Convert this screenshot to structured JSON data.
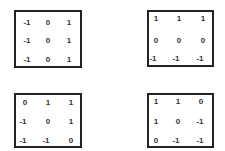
{
  "matrices": [
    {
      "name": "kernel-top-left",
      "rows": [
        [
          "-1",
          "0",
          "1"
        ],
        [
          "-1",
          "0",
          "1"
        ],
        [
          "-1",
          "0",
          "1"
        ]
      ]
    },
    {
      "name": "kernel-top-right",
      "rows": [
        [
          "1",
          "1",
          "1"
        ],
        [
          "0",
          "0",
          "0"
        ],
        [
          "-1",
          "-1",
          "-1"
        ]
      ]
    },
    {
      "name": "kernel-bottom-left",
      "rows": [
        [
          "0",
          "1",
          "1"
        ],
        [
          "-1",
          "0",
          "1"
        ],
        [
          "-1",
          "-1",
          "0"
        ]
      ]
    },
    {
      "name": "kernel-bottom-right",
      "rows": [
        [
          "1",
          "1",
          "0"
        ],
        [
          "1",
          "0",
          "-1"
        ],
        [
          "0",
          "-1",
          "-1"
        ]
      ]
    }
  ],
  "colors": {
    "border": "#222222",
    "text": "#333333",
    "background": "#ffffff"
  }
}
